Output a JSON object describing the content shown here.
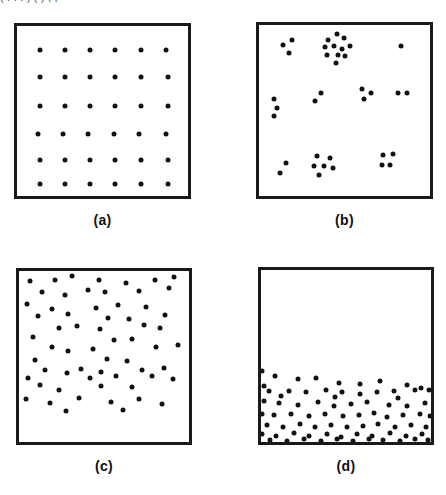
{
  "figure": {
    "top_cropped_caption": "( . . . )                    ( )                                      , ,",
    "background_color": "#ffffff",
    "dot_color": "#121212",
    "border_color": "#1a1a1a",
    "dot_diameter_px": 5,
    "panels": [
      {
        "id": "a",
        "label": "(a)",
        "pattern_type": "regular-grid",
        "box": {
          "x": 14,
          "y": 23,
          "width": 177,
          "height": 176
        },
        "label_position": {
          "x": 14,
          "y": 212,
          "width": 177
        }
      },
      {
        "id": "b",
        "label": "(b)",
        "pattern_type": "clustered",
        "box": {
          "x": 256,
          "y": 22,
          "width": 177,
          "height": 177
        },
        "label_position": {
          "x": 256,
          "y": 212,
          "width": 177
        }
      },
      {
        "id": "c",
        "label": "(c)",
        "pattern_type": "random-uniform",
        "box": {
          "x": 16,
          "y": 268,
          "width": 176,
          "height": 177
        },
        "label_position": {
          "x": 16,
          "y": 458,
          "width": 176
        }
      },
      {
        "id": "d",
        "label": "(d)",
        "pattern_type": "gradient-bottom-concentrated",
        "box": {
          "x": 258,
          "y": 267,
          "width": 176,
          "height": 178
        },
        "label_position": {
          "x": 258,
          "y": 458,
          "width": 176
        }
      }
    ]
  },
  "chart_data": [
    {
      "type": "scatter",
      "panel": "a",
      "title": "(a)",
      "description": "Regular lattice: 6 by 6 evenly spaced points",
      "xlabel": "",
      "ylabel": "",
      "xlim": [
        0,
        100
      ],
      "ylim": [
        0,
        100
      ],
      "grid": false,
      "legend": "none",
      "n_points": 36,
      "points": [
        [
          13.6,
          14.2
        ],
        [
          28.2,
          14.2
        ],
        [
          42.9,
          14.2
        ],
        [
          57.6,
          14.2
        ],
        [
          72.3,
          14.2
        ],
        [
          86.9,
          14.2
        ],
        [
          13.6,
          30.1
        ],
        [
          28.2,
          30.1
        ],
        [
          42.9,
          30.1
        ],
        [
          57.6,
          30.1
        ],
        [
          72.3,
          30.1
        ],
        [
          88.1,
          30.1
        ],
        [
          13.6,
          47.2
        ],
        [
          28.2,
          47.2
        ],
        [
          42.9,
          47.2
        ],
        [
          57.6,
          47.2
        ],
        [
          72.3,
          47.2
        ],
        [
          88.1,
          47.2
        ],
        [
          12.4,
          63.4
        ],
        [
          27.1,
          63.4
        ],
        [
          41.8,
          63.4
        ],
        [
          56.5,
          63.4
        ],
        [
          71.2,
          63.4
        ],
        [
          87.0,
          63.4
        ],
        [
          13.6,
          79.0
        ],
        [
          28.2,
          79.0
        ],
        [
          42.9,
          79.0
        ],
        [
          57.6,
          79.0
        ],
        [
          72.3,
          79.0
        ],
        [
          88.1,
          79.0
        ],
        [
          13.6,
          93.2
        ],
        [
          28.2,
          93.2
        ],
        [
          42.9,
          93.2
        ],
        [
          57.6,
          93.2
        ],
        [
          72.3,
          93.2
        ],
        [
          88.1,
          93.2
        ]
      ]
    },
    {
      "type": "scatter",
      "panel": "b",
      "title": "(b)",
      "description": "Clustered pattern: points aggregate into several tight groups separated by empty space",
      "xlabel": "",
      "ylabel": "",
      "xlim": [
        0,
        100
      ],
      "ylim": [
        0,
        100
      ],
      "grid": false,
      "legend": "none",
      "n_points": 37,
      "points": [
        [
          14.0,
          11.5
        ],
        [
          19.5,
          8.5
        ],
        [
          17.5,
          16.5
        ],
        [
          40.5,
          8.5
        ],
        [
          45.5,
          5.5
        ],
        [
          49.5,
          7.5
        ],
        [
          38.5,
          13.0
        ],
        [
          44.0,
          12.5
        ],
        [
          48.5,
          14.0
        ],
        [
          53.5,
          12.5
        ],
        [
          39.5,
          17.5
        ],
        [
          46.0,
          17.5
        ],
        [
          50.5,
          18.0
        ],
        [
          45.0,
          22.0
        ],
        [
          83.0,
          12.5
        ],
        [
          8.5,
          43.0
        ],
        [
          10.5,
          48.5
        ],
        [
          9.0,
          53.0
        ],
        [
          36.0,
          39.5
        ],
        [
          33.0,
          44.5
        ],
        [
          60.5,
          37.5
        ],
        [
          65.5,
          39.5
        ],
        [
          61.5,
          43.5
        ],
        [
          81.0,
          39.5
        ],
        [
          86.5,
          39.5
        ],
        [
          15.5,
          80.5
        ],
        [
          12.0,
          86.5
        ],
        [
          34.0,
          76.5
        ],
        [
          41.5,
          78.0
        ],
        [
          32.0,
          82.5
        ],
        [
          38.0,
          82.5
        ],
        [
          43.0,
          83.5
        ],
        [
          35.0,
          87.5
        ],
        [
          72.5,
          76.0
        ],
        [
          78.5,
          75.5
        ],
        [
          72.0,
          82.0
        ],
        [
          76.5,
          82.0
        ]
      ]
    },
    {
      "type": "scatter",
      "panel": "c",
      "title": "(c)",
      "description": "Random uniform pattern: points spread across the whole square with no structure",
      "xlabel": "",
      "ylabel": "",
      "xlim": [
        0,
        100
      ],
      "ylim": [
        0,
        100
      ],
      "grid": false,
      "legend": "none",
      "n_points": 62,
      "points": [
        [
          6.5,
          6.0
        ],
        [
          21.0,
          5.0
        ],
        [
          31.0,
          3.0
        ],
        [
          47.0,
          5.5
        ],
        [
          63.0,
          7.0
        ],
        [
          80.0,
          5.0
        ],
        [
          91.0,
          3.5
        ],
        [
          13.5,
          12.5
        ],
        [
          27.0,
          14.0
        ],
        [
          40.5,
          11.0
        ],
        [
          50.5,
          12.5
        ],
        [
          70.5,
          11.5
        ],
        [
          88.0,
          10.0
        ],
        [
          4.5,
          19.5
        ],
        [
          19.5,
          22.5
        ],
        [
          45.5,
          21.5
        ],
        [
          58.5,
          20.0
        ],
        [
          74.5,
          21.0
        ],
        [
          11.0,
          26.5
        ],
        [
          29.0,
          25.0
        ],
        [
          52.5,
          27.5
        ],
        [
          64.5,
          28.0
        ],
        [
          86.0,
          26.0
        ],
        [
          23.5,
          33.5
        ],
        [
          34.0,
          32.0
        ],
        [
          47.5,
          34.0
        ],
        [
          73.5,
          31.5
        ],
        [
          83.0,
          33.5
        ],
        [
          8.0,
          38.5
        ],
        [
          56.0,
          40.5
        ],
        [
          66.5,
          40.0
        ],
        [
          19.5,
          44.5
        ],
        [
          29.0,
          46.5
        ],
        [
          43.5,
          45.5
        ],
        [
          80.5,
          44.5
        ],
        [
          93.5,
          43.0
        ],
        [
          9.5,
          52.0
        ],
        [
          51.5,
          51.5
        ],
        [
          63.5,
          52.5
        ],
        [
          15.5,
          58.0
        ],
        [
          28.5,
          59.5
        ],
        [
          36.5,
          57.5
        ],
        [
          48.0,
          59.0
        ],
        [
          72.5,
          58.0
        ],
        [
          85.0,
          57.0
        ],
        [
          5.5,
          62.5
        ],
        [
          42.0,
          62.5
        ],
        [
          57.0,
          61.5
        ],
        [
          78.0,
          61.5
        ],
        [
          90.5,
          63.0
        ],
        [
          12.5,
          66.5
        ],
        [
          23.5,
          69.5
        ],
        [
          48.0,
          67.5
        ],
        [
          66.5,
          68.0
        ],
        [
          4.0,
          75.0
        ],
        [
          18.0,
          77.0
        ],
        [
          35.5,
          74.5
        ],
        [
          54.0,
          76.5
        ],
        [
          70.5,
          75.0
        ],
        [
          84.0,
          77.5
        ],
        [
          27.5,
          82.0
        ],
        [
          61.0,
          81.0
        ]
      ]
    },
    {
      "type": "scatter",
      "panel": "d",
      "title": "(d)",
      "description": "Gradient pattern: points absent from the upper portion and densely packed in the lower 40 percent",
      "xlabel": "",
      "ylabel": "",
      "xlim": [
        0,
        100
      ],
      "ylim": [
        0,
        100
      ],
      "grid": false,
      "legend": "none",
      "n_points": 78,
      "empty_region_fraction_top": 0.58,
      "points": [
        [
          0.5,
          58.5
        ],
        [
          8.5,
          61.5
        ],
        [
          21.5,
          63.5
        ],
        [
          32.5,
          62.5
        ],
        [
          46.0,
          65.5
        ],
        [
          58.0,
          66.0
        ],
        [
          70.0,
          64.5
        ],
        [
          1.5,
          67.5
        ],
        [
          86.0,
          67.0
        ],
        [
          94.0,
          68.5
        ],
        [
          4.5,
          70.5
        ],
        [
          16.5,
          70.5
        ],
        [
          26.5,
          71.0
        ],
        [
          38.5,
          70.0
        ],
        [
          47.5,
          71.0
        ],
        [
          58.5,
          72.0
        ],
        [
          68.5,
          71.0
        ],
        [
          78.5,
          70.5
        ],
        [
          90.5,
          70.0
        ],
        [
          99.0,
          70.0
        ],
        [
          1.5,
          76.0
        ],
        [
          10.5,
          77.5
        ],
        [
          22.0,
          78.5
        ],
        [
          33.5,
          77.0
        ],
        [
          43.0,
          79.0
        ],
        [
          53.0,
          78.0
        ],
        [
          62.5,
          77.0
        ],
        [
          75.0,
          78.5
        ],
        [
          86.0,
          79.0
        ],
        [
          96.5,
          77.5
        ],
        [
          0.5,
          83.5
        ],
        [
          7.5,
          84.5
        ],
        [
          17.5,
          84.0
        ],
        [
          28.0,
          85.0
        ],
        [
          37.5,
          83.5
        ],
        [
          48.5,
          85.0
        ],
        [
          57.5,
          84.5
        ],
        [
          66.5,
          83.0
        ],
        [
          74.0,
          85.5
        ],
        [
          83.5,
          84.5
        ],
        [
          93.5,
          84.0
        ],
        [
          99.5,
          85.0
        ],
        [
          3.5,
          90.0
        ],
        [
          13.0,
          91.0
        ],
        [
          23.0,
          89.5
        ],
        [
          31.5,
          91.5
        ],
        [
          41.0,
          90.0
        ],
        [
          50.5,
          91.0
        ],
        [
          60.0,
          90.5
        ],
        [
          69.0,
          89.5
        ],
        [
          79.0,
          91.0
        ],
        [
          88.0,
          90.0
        ],
        [
          97.0,
          91.5
        ],
        [
          0.5,
          95.5
        ],
        [
          9.0,
          96.5
        ],
        [
          19.5,
          95.0
        ],
        [
          28.5,
          96.5
        ],
        [
          39.0,
          95.5
        ],
        [
          47.0,
          97.0
        ],
        [
          56.5,
          95.5
        ],
        [
          65.0,
          96.5
        ],
        [
          76.0,
          95.0
        ],
        [
          85.0,
          96.5
        ],
        [
          94.5,
          95.5
        ],
        [
          5.0,
          99.0
        ],
        [
          15.5,
          99.5
        ],
        [
          25.0,
          98.5
        ],
        [
          35.5,
          99.5
        ],
        [
          44.5,
          98.5
        ],
        [
          54.0,
          99.5
        ],
        [
          63.5,
          98.5
        ],
        [
          72.0,
          99.0
        ],
        [
          81.5,
          99.5
        ],
        [
          90.5,
          98.5
        ],
        [
          98.5,
          99.0
        ],
        [
          12.0,
          73.5
        ],
        [
          43.5,
          74.0
        ],
        [
          80.5,
          74.5
        ]
      ]
    }
  ]
}
